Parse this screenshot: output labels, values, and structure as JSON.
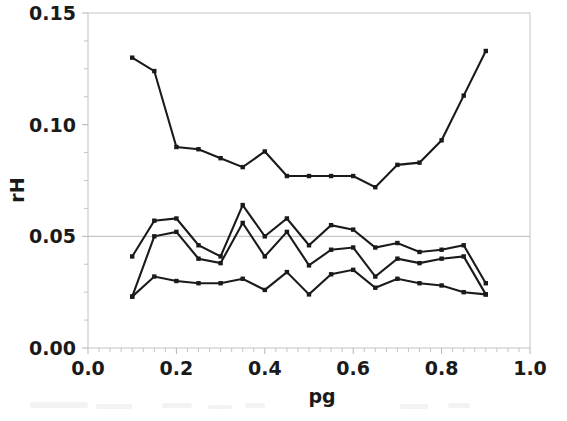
{
  "chart_data": {
    "type": "line",
    "title": "",
    "xlabel": "pg",
    "ylabel": "rH",
    "xlim": [
      0.0,
      1.0
    ],
    "ylim": [
      0.0,
      0.15
    ],
    "xticks": [
      "0.0",
      "0.2",
      "0.4",
      "0.6",
      "0.8",
      "1.0"
    ],
    "xtick_values": [
      0.0,
      0.2,
      0.4,
      0.6,
      0.8,
      1.0
    ],
    "yticks": [
      "0.00",
      "0.05",
      "0.10",
      "0.15"
    ],
    "ytick_values": [
      0.0,
      0.05,
      0.1,
      0.15
    ],
    "grid": "horizontal reference line at rH = 0.05",
    "gridlines_y": [
      0.05
    ],
    "legend": "none",
    "legend_position": "none",
    "marker": "filled square",
    "line_color": "#1a1a1a",
    "x": [
      0.1,
      0.15,
      0.2,
      0.25,
      0.3,
      0.35,
      0.4,
      0.45,
      0.5,
      0.55,
      0.6,
      0.65,
      0.7,
      0.75,
      0.8,
      0.85,
      0.9
    ],
    "series": [
      {
        "name": "upper curve",
        "values": [
          0.13,
          0.124,
          0.09,
          0.089,
          0.085,
          0.081,
          0.088,
          0.077,
          0.077,
          0.077,
          0.077,
          0.072,
          0.082,
          0.083,
          0.093,
          0.113,
          0.133
        ]
      },
      {
        "name": "middle curve A",
        "values": [
          0.041,
          0.057,
          0.058,
          0.046,
          0.041,
          0.064,
          0.05,
          0.058,
          0.046,
          0.055,
          0.053,
          0.045,
          0.047,
          0.043,
          0.044,
          0.046,
          0.029
        ]
      },
      {
        "name": "middle curve B",
        "values": [
          0.023,
          0.05,
          0.052,
          0.04,
          0.038,
          0.056,
          0.041,
          0.052,
          0.037,
          0.044,
          0.045,
          0.032,
          0.04,
          0.038,
          0.04,
          0.041,
          0.024
        ]
      },
      {
        "name": "lower curve",
        "values": [
          0.023,
          0.032,
          0.03,
          0.029,
          0.029,
          0.031,
          0.026,
          0.034,
          0.024,
          0.033,
          0.035,
          0.027,
          0.031,
          0.029,
          0.028,
          0.025,
          0.024
        ]
      }
    ]
  }
}
